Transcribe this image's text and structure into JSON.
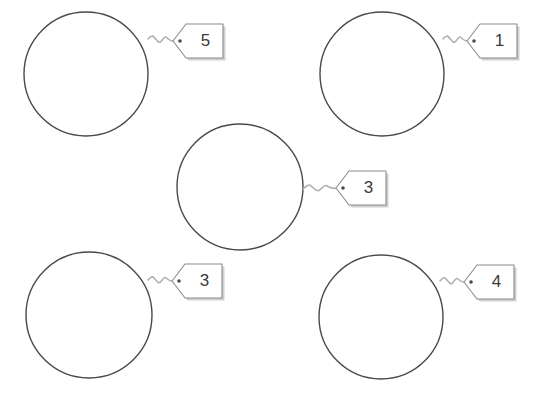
{
  "worksheet": {
    "title": "Circles with numbered tags",
    "background_color": "#ffffff",
    "circle_stroke_color": "#4a4a4a",
    "circle_fill_color": "#ffffff",
    "tag_stroke_color": "#8a8a8a",
    "tag_fill_color": "#ffffff",
    "tag_shadow_color": "#b8b8b8",
    "string_color": "#b0b0b0",
    "hole_color": "#4a4a4a",
    "number_color": "#3a3a3a"
  },
  "items": [
    {
      "id": "top-left",
      "label": "5",
      "circle": {
        "cx": 86,
        "cy": 74,
        "r": 62
      },
      "tag": {
        "x": 173,
        "y": 24,
        "width": 50,
        "height": 34,
        "point_inset": 13
      },
      "hole": {
        "cx": 180,
        "cy": 41,
        "r": 1.8
      },
      "string": {
        "from_x": 148,
        "from_y": 39,
        "to_x": 175,
        "to_y": 41
      }
    },
    {
      "id": "top-right",
      "label": "1",
      "circle": {
        "cx": 382,
        "cy": 74,
        "r": 62
      },
      "tag": {
        "x": 467,
        "y": 24,
        "width": 50,
        "height": 34,
        "point_inset": 13
      },
      "hole": {
        "cx": 474,
        "cy": 41,
        "r": 1.8
      },
      "string": {
        "from_x": 443,
        "from_y": 39,
        "to_x": 469,
        "to_y": 41
      }
    },
    {
      "id": "center",
      "label": "3",
      "circle": {
        "cx": 240,
        "cy": 187,
        "r": 63
      },
      "tag": {
        "x": 336,
        "y": 171,
        "width": 50,
        "height": 34,
        "point_inset": 13
      },
      "hole": {
        "cx": 343,
        "cy": 188,
        "r": 1.8
      },
      "string": {
        "from_x": 303,
        "from_y": 189,
        "to_x": 338,
        "to_y": 188
      }
    },
    {
      "id": "bottom-left",
      "label": "3",
      "circle": {
        "cx": 89,
        "cy": 315,
        "r": 63
      },
      "tag": {
        "x": 172,
        "y": 264,
        "width": 50,
        "height": 34,
        "point_inset": 13
      },
      "hole": {
        "cx": 179,
        "cy": 281,
        "r": 1.8
      },
      "string": {
        "from_x": 148,
        "from_y": 280,
        "to_x": 174,
        "to_y": 281
      }
    },
    {
      "id": "bottom-right",
      "label": "4",
      "circle": {
        "cx": 381,
        "cy": 317,
        "r": 62
      },
      "tag": {
        "x": 464,
        "y": 265,
        "width": 50,
        "height": 34,
        "point_inset": 13
      },
      "hole": {
        "cx": 471,
        "cy": 282,
        "r": 1.8
      },
      "string": {
        "from_x": 440,
        "from_y": 281,
        "to_x": 466,
        "to_y": 282
      }
    }
  ]
}
